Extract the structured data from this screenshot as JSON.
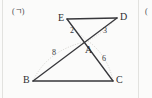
{
  "page": {
    "panel_label": "(ㄱ)",
    "right_edge_fragment": "(",
    "background_color": "#fbfbfa",
    "ink_color": "#2e2e32"
  },
  "figure": {
    "name": "two-triangles-sharing-intersection-point",
    "vertices": [
      {
        "id": "E",
        "label": "E",
        "x": 67,
        "y": 19
      },
      {
        "id": "D",
        "label": "D",
        "x": 117,
        "y": 18
      },
      {
        "id": "A",
        "label": "A",
        "x": 88,
        "y": 41
      },
      {
        "id": "B",
        "label": "B",
        "x": 33,
        "y": 81
      },
      {
        "id": "C",
        "label": "C",
        "x": 113,
        "y": 81
      }
    ],
    "vertex_label_positions": [
      {
        "id": "E",
        "label": "E",
        "x": 58,
        "y": 13
      },
      {
        "id": "D",
        "label": "D",
        "x": 120,
        "y": 12
      },
      {
        "id": "A",
        "label": "A",
        "x": 85,
        "y": 45
      },
      {
        "id": "B",
        "label": "B",
        "x": 23,
        "y": 75
      },
      {
        "id": "C",
        "label": "C",
        "x": 116,
        "y": 75
      }
    ],
    "segments": [
      {
        "id": "ED",
        "from": "E",
        "to": "D",
        "style": "solid"
      },
      {
        "id": "BC",
        "from": "B",
        "to": "C",
        "style": "solid"
      },
      {
        "id": "EC",
        "from": "E",
        "to": "C",
        "style": "solid",
        "note": "passes through A"
      },
      {
        "id": "DB",
        "from": "D",
        "to": "B",
        "style": "solid",
        "note": "passes through A"
      }
    ],
    "measure_arcs": [
      {
        "id": "arc-BA",
        "from": "B",
        "to": "A",
        "style": "dotted"
      },
      {
        "id": "arc-AC",
        "from": "A",
        "to": "C",
        "style": "dotted"
      },
      {
        "id": "arc-EA",
        "from": "E",
        "to": "A",
        "style": "dotted"
      },
      {
        "id": "arc-AD",
        "from": "A",
        "to": "D",
        "style": "dotted"
      }
    ],
    "segment_labels": [
      {
        "id": "label-EA",
        "text": "2",
        "x": 70,
        "y": 27,
        "refers_to": "EA"
      },
      {
        "id": "label-AD",
        "text": "3",
        "x": 103,
        "y": 27,
        "refers_to": "AD"
      },
      {
        "id": "label-BA",
        "text": "8",
        "x": 52,
        "y": 49,
        "refers_to": "BA"
      },
      {
        "id": "label-AC",
        "text": "6",
        "x": 102,
        "y": 55,
        "refers_to": "AC"
      }
    ]
  }
}
